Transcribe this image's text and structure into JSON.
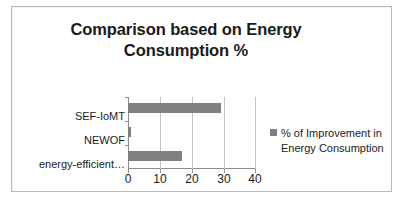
{
  "chart_data": {
    "type": "bar",
    "orientation": "horizontal",
    "title": "Comparison based on Energy Consumption %",
    "title_lines": [
      "Comparison based on Energy",
      "Consumption %"
    ],
    "categories": [
      "SEF-IoMT",
      "NEWOF",
      "energy-efficient…"
    ],
    "values": [
      29,
      1,
      17
    ],
    "series": [
      {
        "name": "% of Improvement in Energy Consumption",
        "values": [
          29,
          1,
          17
        ],
        "color": "#808080"
      }
    ],
    "xlabel": "",
    "ylabel": "",
    "xlim": [
      0,
      40
    ],
    "xticks": [
      0,
      10,
      20,
      30,
      40
    ],
    "xtick_labels": [
      "0",
      "10",
      "20",
      "30",
      "40"
    ],
    "grid": "vertical",
    "legend": {
      "position": "right",
      "entries": [
        {
          "label": "% of Improvement in Energy Consumption",
          "label_lines": [
            "% of Improvement in",
            "Energy Consumption"
          ],
          "color": "#808080",
          "marker": "square-swatch"
        }
      ]
    },
    "colors": {
      "bar": "#808080",
      "axis": "#8c8c8c",
      "gridline": "#c4c4c4",
      "text": "#1a1a1a",
      "border": "#b9b9b9",
      "background": "#ffffff"
    }
  }
}
